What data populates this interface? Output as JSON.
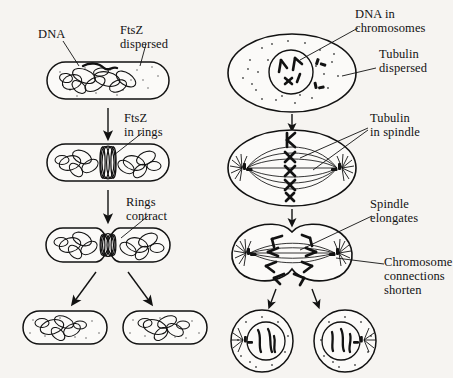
{
  "figure": {
    "background_color": "#f6f4f1",
    "ink_color": "#121212"
  },
  "left_column": {
    "name": "bacterial-cell-division",
    "labels": {
      "dna": "DNA",
      "ftsz_dispersed_line1": "FtsZ",
      "ftsz_dispersed_line2": "dispersed",
      "ftsz_rings_line1": "FtsZ",
      "ftsz_rings_line2": "in rings",
      "rings_contract_line1": "Rings",
      "rings_contract_line2": "contract"
    },
    "stages": [
      {
        "id": "stage-1",
        "caption": "Rod-shaped bacterium with tangled DNA and dispersed FtsZ"
      },
      {
        "id": "stage-2",
        "caption": "FtsZ assembled into rings at midcell"
      },
      {
        "id": "stage-3",
        "caption": "Rings contract, cell constricts at midcell"
      },
      {
        "id": "stage-4",
        "caption": "Two daughter bacteria"
      }
    ]
  },
  "right_column": {
    "name": "eukaryotic-mitosis",
    "labels": {
      "dna_in_chromosomes_line1": "DNA in",
      "dna_in_chromosomes_line2": "chromosomes",
      "tubulin_dispersed_line1": "Tubulin",
      "tubulin_dispersed_line2": "dispersed",
      "tubulin_in_spindle_line1": "Tubulin",
      "tubulin_in_spindle_line2": "in spindle",
      "spindle_elongates_line1": "Spindle",
      "spindle_elongates_line2": "elongates",
      "chromosome_connections_line1": "Chromosome",
      "chromosome_connections_line2": "connections",
      "chromosome_connections_line3": "shorten"
    },
    "stages": [
      {
        "id": "stage-1",
        "caption": "Cell with nucleus containing chromosomes; tubulin dispersed"
      },
      {
        "id": "stage-2",
        "caption": "Metaphase: chromosomes aligned, tubulin in spindle"
      },
      {
        "id": "stage-3",
        "caption": "Anaphase: spindle elongates, chromosomes move to poles"
      },
      {
        "id": "stage-4",
        "caption": "Two daughter cells with nuclei"
      }
    ]
  }
}
